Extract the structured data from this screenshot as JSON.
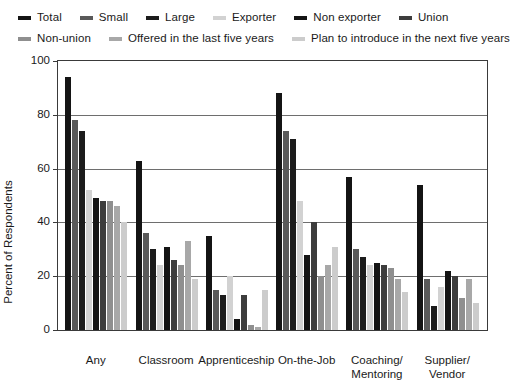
{
  "chart_data": {
    "type": "bar",
    "title": "",
    "xlabel": "",
    "ylabel": "Percent of Respondents",
    "ylim": [
      0,
      100
    ],
    "yticks": [
      0,
      20,
      40,
      60,
      80,
      100
    ],
    "grid": true,
    "legend_position": "top",
    "categories": [
      "Any",
      "Classroom",
      "Apprenticeship",
      "On-the-Job",
      "Coaching/\nMentoring",
      "Supplier/\nVendor"
    ],
    "series": [
      {
        "name": "Total",
        "color": "#141414",
        "values": [
          94,
          63,
          35,
          88,
          57,
          54
        ]
      },
      {
        "name": "Small",
        "color": "#595959",
        "values": [
          78,
          36,
          15,
          74,
          30,
          19
        ]
      },
      {
        "name": "Large",
        "color": "#1c1c1c",
        "values": [
          74,
          30,
          13,
          71,
          27,
          9
        ]
      },
      {
        "name": "Exporter",
        "color": "#d2d2d2",
        "values": [
          52,
          24,
          20,
          48,
          24,
          16
        ]
      },
      {
        "name": "Non exporter",
        "color": "#141414",
        "values": [
          49,
          31,
          4,
          28,
          25,
          22
        ]
      },
      {
        "name": "Union",
        "color": "#3d3d3d",
        "values": [
          48,
          26,
          13,
          40,
          24,
          20
        ]
      },
      {
        "name": "Non-union",
        "color": "#8f8f8f",
        "values": [
          48,
          24,
          2,
          20,
          23,
          12
        ]
      },
      {
        "name": "Offered in the last five years",
        "color": "#a8a8a8",
        "values": [
          46,
          33,
          1,
          24,
          19,
          19
        ]
      },
      {
        "name": "Plan to introduce in the next five years",
        "color": "#cccccc",
        "values": [
          40,
          19,
          15,
          31,
          14,
          10
        ]
      }
    ]
  },
  "legend": {
    "rows": [
      [
        {
          "label": "Total",
          "color": "#141414"
        },
        {
          "label": "Small",
          "color": "#595959"
        },
        {
          "label": "Large",
          "color": "#1c1c1c"
        },
        {
          "label": "Exporter",
          "color": "#d2d2d2"
        },
        {
          "label": "Non exporter",
          "color": "#141414"
        },
        {
          "label": "Union",
          "color": "#3d3d3d"
        }
      ],
      [
        {
          "label": "Non-union",
          "color": "#8f8f8f"
        },
        {
          "label": "Offered in the last five years",
          "color": "#a8a8a8"
        },
        {
          "label": "Plan to introduce in the next five years",
          "color": "#cccccc"
        }
      ]
    ]
  }
}
